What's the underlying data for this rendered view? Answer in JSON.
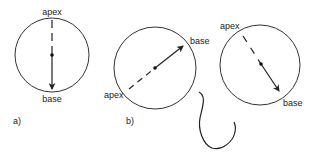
{
  "figure": {
    "stroke_color": "#333333",
    "panels": [
      {
        "id": "a",
        "panel_label": "a)",
        "apex_label": "apex",
        "base_label": "base"
      },
      {
        "id": "b",
        "panel_label": "b)",
        "apex_label": "apex",
        "base_label": "base"
      },
      {
        "id": "c",
        "apex_label": "apex",
        "base_label": "base"
      }
    ]
  }
}
